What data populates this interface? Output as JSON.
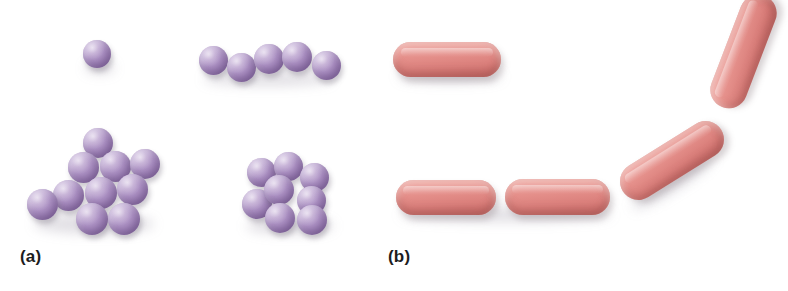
{
  "figure": {
    "width": 788,
    "height": 291,
    "background": "#ffffff",
    "caption_a": "(a)",
    "caption_b": "(b)"
  },
  "colors": {
    "coccus_light": "#cdb9dc",
    "coccus_mid": "#ad92c4",
    "coccus_dark": "#7e6298",
    "bacillus_light": "#f0b0ab",
    "bacillus_mid": "#e5908b",
    "bacillus_dark": "#c06663",
    "label_text": "#1d1d1d",
    "shadow": "rgba(120,110,130,0.22)"
  },
  "panels": [
    {
      "id": "panel-a",
      "label": "(a)",
      "cell_shape": "coccus",
      "label_position": {
        "x": 20,
        "y": 248
      },
      "groups": [
        {
          "name": "single-coccus",
          "count": 1,
          "cells": [
            {
              "x": 83,
              "y": 40,
              "d": 28
            }
          ]
        },
        {
          "name": "streptococcus-chain",
          "count": 5,
          "cells": [
            {
              "x": 199,
              "y": 46,
              "d": 29
            },
            {
              "x": 227,
              "y": 53,
              "d": 29
            },
            {
              "x": 254,
              "y": 44,
              "d": 30
            },
            {
              "x": 282,
              "y": 42,
              "d": 30
            },
            {
              "x": 312,
              "y": 51,
              "d": 29
            }
          ]
        },
        {
          "name": "staphylococcus-cluster",
          "count": 10,
          "cells": [
            {
              "x": 83,
              "y": 128,
              "d": 30
            },
            {
              "x": 68,
              "y": 152,
              "d": 31
            },
            {
              "x": 100,
              "y": 151,
              "d": 31
            },
            {
              "x": 130,
              "y": 149,
              "d": 30
            },
            {
              "x": 53,
              "y": 180,
              "d": 31
            },
            {
              "x": 85,
              "y": 177,
              "d": 32
            },
            {
              "x": 117,
              "y": 174,
              "d": 31
            },
            {
              "x": 27,
              "y": 189,
              "d": 31
            },
            {
              "x": 76,
              "y": 203,
              "d": 32
            },
            {
              "x": 108,
              "y": 203,
              "d": 32
            }
          ]
        },
        {
          "name": "sarcina-packet",
          "count": 8,
          "cells": [
            {
              "x": 247,
              "y": 158,
              "d": 29
            },
            {
              "x": 274,
              "y": 152,
              "d": 29
            },
            {
              "x": 300,
              "y": 163,
              "d": 29
            },
            {
              "x": 264,
              "y": 175,
              "d": 30
            },
            {
              "x": 297,
              "y": 186,
              "d": 29
            },
            {
              "x": 242,
              "y": 189,
              "d": 30
            },
            {
              "x": 265,
              "y": 203,
              "d": 30
            },
            {
              "x": 297,
              "y": 205,
              "d": 30
            }
          ]
        }
      ]
    },
    {
      "id": "panel-b",
      "label": "(b)",
      "cell_shape": "bacillus",
      "label_position": {
        "x": 388,
        "y": 248
      },
      "groups": [
        {
          "name": "single-bacillus",
          "count": 1,
          "cells": [
            {
              "x": 393,
              "y": 42,
              "w": 108,
              "h": 35,
              "rot": 0
            }
          ]
        },
        {
          "name": "streptobacillus-chain",
          "count": 4,
          "cells": [
            {
              "x": 396,
              "y": 180,
              "w": 100,
              "h": 35,
              "rot": 0
            },
            {
              "x": 505,
              "y": 179,
              "w": 105,
              "h": 36,
              "rot": 0
            },
            {
              "x": 614,
              "y": 142,
              "w": 116,
              "h": 37,
              "rot": -32
            },
            {
              "x": 684,
              "y": 33,
              "w": 119,
              "h": 37,
              "rot": -69
            }
          ]
        }
      ]
    }
  ]
}
